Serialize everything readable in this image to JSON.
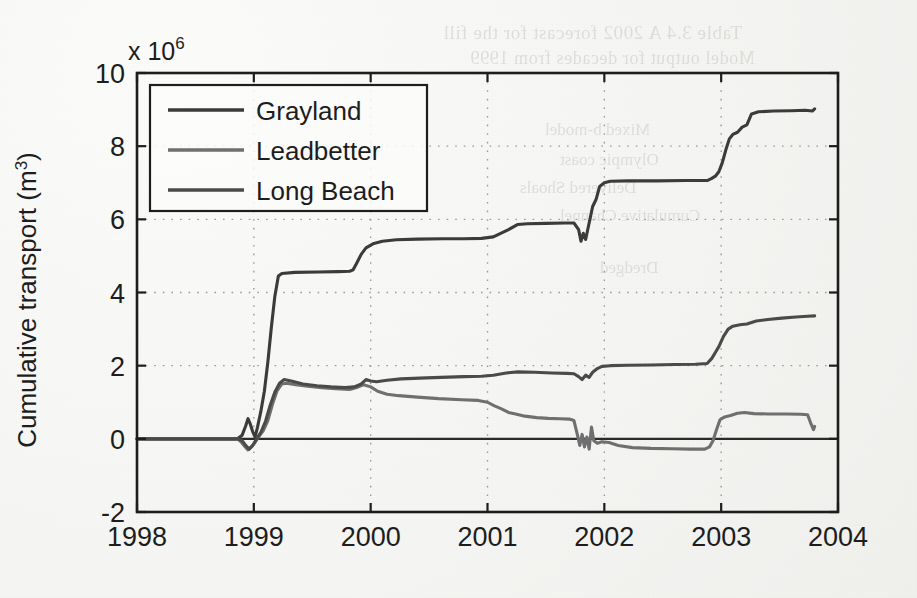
{
  "figure": {
    "background_color": "#f5f5f3",
    "axis_color": "#1d1d1d",
    "grid_color": "#9a9a9a"
  },
  "bleed_through": {
    "line1": "Table 3.4  A 2002 forecast for the fill",
    "line2": "Model output for decades from 1999",
    "line3": "Mixed b-model",
    "line4": "Olympic coast",
    "line5": "Delivered Shoals",
    "line6": "Cumulative Channel",
    "line7": "Dredged"
  },
  "chart_data": {
    "type": "line",
    "title": "",
    "xlabel": "",
    "ylabel": "Cumulative transport (m",
    "ylabel_sup": "3",
    "ylabel_tail": ")",
    "y_multiplier": "x 10",
    "y_multiplier_exp": "6",
    "xlim": [
      1998,
      2004
    ],
    "ylim": [
      -2,
      10
    ],
    "xticks": [
      1998,
      1999,
      2000,
      2001,
      2002,
      2003,
      2004
    ],
    "xticklabels": [
      "1998",
      "1999",
      "2000",
      "2001",
      "2002",
      "2003",
      "2004"
    ],
    "yticks": [
      -2,
      0,
      2,
      4,
      6,
      8,
      10
    ],
    "yticklabels": [
      "-2",
      "0",
      "2",
      "4",
      "6",
      "8",
      "10"
    ],
    "grid": true,
    "grid_style": "dotted",
    "legend_position": "upper-left",
    "units": "m^3 (values shown in millions)",
    "series": [
      {
        "name": "Grayland",
        "color": "#3b3b3b",
        "width": 3.1,
        "points": [
          [
            1998.0,
            0.0
          ],
          [
            1998.86,
            0.0
          ],
          [
            1998.9,
            0.1
          ],
          [
            1998.93,
            0.35
          ],
          [
            1998.95,
            0.55
          ],
          [
            1998.97,
            0.4
          ],
          [
            1998.99,
            0.2
          ],
          [
            1999.01,
            0.05
          ],
          [
            1999.03,
            0.3
          ],
          [
            1999.06,
            0.75
          ],
          [
            1999.09,
            1.3
          ],
          [
            1999.12,
            2.1
          ],
          [
            1999.15,
            3.05
          ],
          [
            1999.18,
            3.9
          ],
          [
            1999.21,
            4.45
          ],
          [
            1999.24,
            4.52
          ],
          [
            1999.35,
            4.55
          ],
          [
            1999.55,
            4.56
          ],
          [
            1999.72,
            4.57
          ],
          [
            1999.82,
            4.58
          ],
          [
            1999.85,
            4.62
          ],
          [
            1999.88,
            4.8
          ],
          [
            1999.92,
            5.05
          ],
          [
            1999.96,
            5.22
          ],
          [
            2000.02,
            5.33
          ],
          [
            2000.1,
            5.4
          ],
          [
            2000.22,
            5.44
          ],
          [
            2000.4,
            5.46
          ],
          [
            2000.62,
            5.47
          ],
          [
            2000.8,
            5.47
          ],
          [
            2000.95,
            5.48
          ],
          [
            2001.05,
            5.52
          ],
          [
            2001.18,
            5.72
          ],
          [
            2001.26,
            5.86
          ],
          [
            2001.34,
            5.88
          ],
          [
            2001.5,
            5.89
          ],
          [
            2001.66,
            5.9
          ],
          [
            2001.74,
            5.9
          ],
          [
            2001.78,
            5.72
          ],
          [
            2001.8,
            5.4
          ],
          [
            2001.82,
            5.62
          ],
          [
            2001.84,
            5.45
          ],
          [
            2001.86,
            5.75
          ],
          [
            2001.88,
            6.05
          ],
          [
            2001.9,
            6.35
          ],
          [
            2001.93,
            6.55
          ],
          [
            2001.96,
            6.9
          ],
          [
            2002.0,
            7.0
          ],
          [
            2002.05,
            7.04
          ],
          [
            2002.2,
            7.05
          ],
          [
            2002.45,
            7.05
          ],
          [
            2002.7,
            7.06
          ],
          [
            2002.88,
            7.06
          ],
          [
            2002.92,
            7.12
          ],
          [
            2002.95,
            7.18
          ],
          [
            2002.98,
            7.3
          ],
          [
            2003.01,
            7.55
          ],
          [
            2003.04,
            7.9
          ],
          [
            2003.07,
            8.2
          ],
          [
            2003.1,
            8.32
          ],
          [
            2003.14,
            8.38
          ],
          [
            2003.18,
            8.52
          ],
          [
            2003.22,
            8.58
          ],
          [
            2003.26,
            8.88
          ],
          [
            2003.32,
            8.94
          ],
          [
            2003.45,
            8.96
          ],
          [
            2003.6,
            8.97
          ],
          [
            2003.72,
            8.98
          ],
          [
            2003.78,
            8.96
          ],
          [
            2003.8,
            9.02
          ]
        ]
      },
      {
        "name": "Leadbetter",
        "color": "#6f6f6f",
        "width": 3.1,
        "points": [
          [
            1998.0,
            0.0
          ],
          [
            1998.86,
            0.0
          ],
          [
            1998.89,
            -0.08
          ],
          [
            1998.92,
            -0.2
          ],
          [
            1998.95,
            -0.3
          ],
          [
            1998.98,
            -0.22
          ],
          [
            1999.01,
            -0.1
          ],
          [
            1999.04,
            0.05
          ],
          [
            1999.08,
            0.22
          ],
          [
            1999.12,
            0.5
          ],
          [
            1999.16,
            0.95
          ],
          [
            1999.2,
            1.32
          ],
          [
            1999.24,
            1.5
          ],
          [
            1999.28,
            1.52
          ],
          [
            1999.36,
            1.48
          ],
          [
            1999.46,
            1.44
          ],
          [
            1999.58,
            1.4
          ],
          [
            1999.7,
            1.37
          ],
          [
            1999.82,
            1.35
          ],
          [
            1999.88,
            1.4
          ],
          [
            1999.94,
            1.48
          ],
          [
            2000.0,
            1.42
          ],
          [
            2000.06,
            1.3
          ],
          [
            2000.14,
            1.22
          ],
          [
            2000.24,
            1.18
          ],
          [
            2000.4,
            1.14
          ],
          [
            2000.58,
            1.1
          ],
          [
            2000.78,
            1.07
          ],
          [
            2000.92,
            1.05
          ],
          [
            2001.0,
            1.0
          ],
          [
            2001.06,
            0.9
          ],
          [
            2001.12,
            0.82
          ],
          [
            2001.18,
            0.72
          ],
          [
            2001.24,
            0.68
          ],
          [
            2001.32,
            0.62
          ],
          [
            2001.42,
            0.58
          ],
          [
            2001.52,
            0.56
          ],
          [
            2001.62,
            0.55
          ],
          [
            2001.7,
            0.54
          ],
          [
            2001.74,
            0.5
          ],
          [
            2001.77,
            0.1
          ],
          [
            2001.79,
            -0.18
          ],
          [
            2001.81,
            0.12
          ],
          [
            2001.83,
            -0.22
          ],
          [
            2001.85,
            0.05
          ],
          [
            2001.87,
            -0.28
          ],
          [
            2001.89,
            0.32
          ],
          [
            2001.91,
            -0.05
          ],
          [
            2001.94,
            -0.12
          ],
          [
            2001.98,
            -0.08
          ],
          [
            2002.04,
            -0.1
          ],
          [
            2002.12,
            -0.18
          ],
          [
            2002.24,
            -0.24
          ],
          [
            2002.4,
            -0.26
          ],
          [
            2002.58,
            -0.27
          ],
          [
            2002.74,
            -0.28
          ],
          [
            2002.86,
            -0.28
          ],
          [
            2002.9,
            -0.22
          ],
          [
            2002.93,
            -0.05
          ],
          [
            2002.96,
            0.25
          ],
          [
            2002.99,
            0.52
          ],
          [
            2003.03,
            0.6
          ],
          [
            2003.08,
            0.64
          ],
          [
            2003.14,
            0.7
          ],
          [
            2003.2,
            0.72
          ],
          [
            2003.28,
            0.69
          ],
          [
            2003.4,
            0.68
          ],
          [
            2003.55,
            0.68
          ],
          [
            2003.68,
            0.67
          ],
          [
            2003.74,
            0.66
          ],
          [
            2003.77,
            0.4
          ],
          [
            2003.79,
            0.25
          ],
          [
            2003.8,
            0.34
          ]
        ]
      },
      {
        "name": "Long Beach",
        "color": "#4a4a4a",
        "width": 3.1,
        "points": [
          [
            1998.0,
            0.0
          ],
          [
            1998.86,
            0.0
          ],
          [
            1998.9,
            -0.05
          ],
          [
            1998.93,
            -0.18
          ],
          [
            1998.96,
            -0.28
          ],
          [
            1998.99,
            -0.18
          ],
          [
            1999.02,
            -0.02
          ],
          [
            1999.06,
            0.18
          ],
          [
            1999.1,
            0.48
          ],
          [
            1999.14,
            0.92
          ],
          [
            1999.18,
            1.28
          ],
          [
            1999.22,
            1.52
          ],
          [
            1999.26,
            1.62
          ],
          [
            1999.32,
            1.58
          ],
          [
            1999.42,
            1.5
          ],
          [
            1999.54,
            1.45
          ],
          [
            1999.66,
            1.42
          ],
          [
            1999.78,
            1.4
          ],
          [
            1999.86,
            1.42
          ],
          [
            1999.92,
            1.5
          ],
          [
            1999.96,
            1.62
          ],
          [
            2000.0,
            1.58
          ],
          [
            2000.05,
            1.56
          ],
          [
            2000.14,
            1.6
          ],
          [
            2000.26,
            1.64
          ],
          [
            2000.42,
            1.66
          ],
          [
            2000.6,
            1.68
          ],
          [
            2000.8,
            1.7
          ],
          [
            2000.95,
            1.71
          ],
          [
            2001.05,
            1.74
          ],
          [
            2001.16,
            1.8
          ],
          [
            2001.26,
            1.83
          ],
          [
            2001.4,
            1.82
          ],
          [
            2001.55,
            1.8
          ],
          [
            2001.68,
            1.79
          ],
          [
            2001.74,
            1.78
          ],
          [
            2001.78,
            1.7
          ],
          [
            2001.81,
            1.62
          ],
          [
            2001.84,
            1.74
          ],
          [
            2001.87,
            1.68
          ],
          [
            2001.9,
            1.82
          ],
          [
            2001.94,
            1.92
          ],
          [
            2001.98,
            1.98
          ],
          [
            2002.05,
            2.0
          ],
          [
            2002.2,
            2.01
          ],
          [
            2002.4,
            2.02
          ],
          [
            2002.6,
            2.03
          ],
          [
            2002.78,
            2.04
          ],
          [
            2002.88,
            2.06
          ],
          [
            2002.92,
            2.2
          ],
          [
            2002.95,
            2.36
          ],
          [
            2002.98,
            2.52
          ],
          [
            2003.02,
            2.8
          ],
          [
            2003.06,
            3.0
          ],
          [
            2003.1,
            3.08
          ],
          [
            2003.16,
            3.12
          ],
          [
            2003.22,
            3.14
          ],
          [
            2003.3,
            3.22
          ],
          [
            2003.4,
            3.26
          ],
          [
            2003.52,
            3.3
          ],
          [
            2003.64,
            3.33
          ],
          [
            2003.74,
            3.35
          ],
          [
            2003.8,
            3.36
          ]
        ]
      }
    ]
  },
  "legend": {
    "entries": [
      {
        "label": "Grayland",
        "color": "#3b3b3b"
      },
      {
        "label": "Leadbetter",
        "color": "#6f6f6f"
      },
      {
        "label": "Long Beach",
        "color": "#4a4a4a"
      }
    ]
  }
}
